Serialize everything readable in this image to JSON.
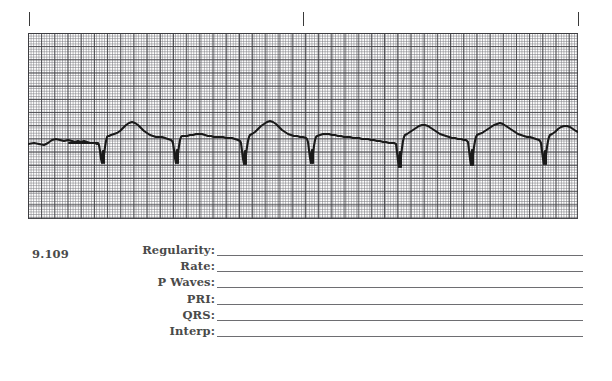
{
  "page": {
    "background_color": "#ffffff",
    "text_color": "#4a4a4a",
    "rule_color": "#6e6e72"
  },
  "tick_marks": {
    "name": "alignment-tick-marks",
    "color": "#3a3a3a",
    "positions_px": [
      29,
      303,
      578
    ]
  },
  "question": {
    "number": "9.109"
  },
  "ecg": {
    "grid": {
      "fine_color": "#78787e",
      "major_color": "#3c3c40",
      "fine_spacing_px": 2.64,
      "major_spacing_px": 13.2,
      "width_px": 550,
      "height_px": 186
    },
    "trace": {
      "color": "#1a1a1a",
      "baseline_y_px": 140,
      "qrs_positions_px": [
        70,
        145,
        213,
        280,
        368,
        440,
        513
      ],
      "beat_count": 8
    }
  },
  "fields": [
    {
      "label": "Regularity:",
      "value": ""
    },
    {
      "label": "Rate:",
      "value": ""
    },
    {
      "label": "P Waves:",
      "value": ""
    },
    {
      "label": "PRI:",
      "value": ""
    },
    {
      "label": "QRS:",
      "value": ""
    },
    {
      "label": "Interp:",
      "value": ""
    }
  ]
}
